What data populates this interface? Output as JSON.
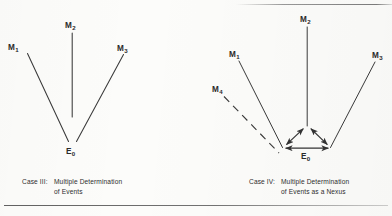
{
  "figure": {
    "background_color": "#fcfcfa",
    "line_color": "#3a3a3a",
    "panels": [
      {
        "id": "case-3",
        "case_label": "Case III:",
        "caption_line1": "Multiple Determination",
        "caption_line2": "of Events",
        "nodes": [
          {
            "id": "m1",
            "label": "M",
            "sub": "1"
          },
          {
            "id": "m2",
            "label": "M",
            "sub": "2"
          },
          {
            "id": "m3",
            "label": "M",
            "sub": "3"
          },
          {
            "id": "e0",
            "label": "E",
            "sub": "0"
          }
        ]
      },
      {
        "id": "case-4",
        "case_label": "Case IV:",
        "caption_line1": "Multiple Determination",
        "caption_line2": "of Events as a Nexus",
        "nodes": [
          {
            "id": "m1",
            "label": "M",
            "sub": "1"
          },
          {
            "id": "m2",
            "label": "M",
            "sub": "2"
          },
          {
            "id": "m3",
            "label": "M",
            "sub": "3"
          },
          {
            "id": "m4",
            "label": "M",
            "sub": "4"
          },
          {
            "id": "e0",
            "label": "E",
            "sub": "0"
          }
        ]
      }
    ]
  },
  "labels": {
    "left_m1": "M",
    "left_m1_sub": "1",
    "left_m2": "M",
    "left_m2_sub": "2",
    "left_m3": "M",
    "left_m3_sub": "3",
    "left_e0": "E",
    "left_e0_sub": "0",
    "right_m1": "M",
    "right_m1_sub": "1",
    "right_m2": "M",
    "right_m2_sub": "2",
    "right_m3": "M",
    "right_m3_sub": "3",
    "right_m4": "M",
    "right_m4_sub": "4",
    "right_e0": "E",
    "right_e0_sub": "0"
  },
  "captions": {
    "left_case": "Case III:",
    "left_line1": "Multiple Determination",
    "left_line2": "of Events",
    "right_case": "Case IV:",
    "right_line1": "Multiple Determination",
    "right_line2": "of Events as a Nexus"
  }
}
